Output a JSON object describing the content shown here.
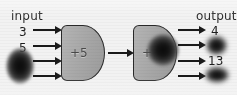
{
  "diagram": {
    "input_label": "input",
    "output_label": "output",
    "inputs": [
      {
        "value": "3",
        "redacted": false
      },
      {
        "value": "5",
        "redacted": false
      },
      {
        "value": "",
        "redacted": true
      },
      {
        "value": "",
        "redacted": true
      }
    ],
    "outputs": [
      {
        "value": "4",
        "redacted": false
      },
      {
        "value": "",
        "redacted": true
      },
      {
        "value": "13",
        "redacted": false
      },
      {
        "value": "",
        "redacted": true
      }
    ],
    "units": [
      {
        "operator": "+5",
        "redacted": false
      },
      {
        "operator": "+",
        "redacted": true
      }
    ],
    "colors": {
      "background": "#f2f2f2",
      "unit_fill": "#a8a8a8",
      "unit_stroke": "#2a2a2a",
      "arrow": "#1a1a1a",
      "text": "#1c1c1c",
      "blob": "#0a0a0a"
    }
  }
}
